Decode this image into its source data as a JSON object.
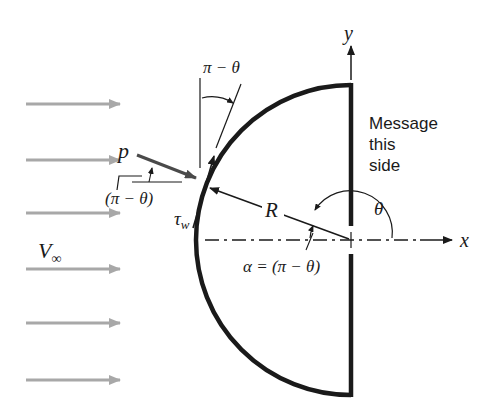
{
  "diagram": {
    "type": "physics-free-body",
    "labels": {
      "y_axis": "y",
      "x_axis": "x",
      "freestream": "V",
      "freestream_sub": "∞",
      "pressure": "p",
      "shear": "τ",
      "shear_sub": "w",
      "radius": "R",
      "theta": "θ",
      "pi_minus_theta_top": "π − θ",
      "pi_minus_theta_paren": "(π − θ)",
      "alpha_eq": "α = (π − θ)",
      "message_line1": "Message",
      "message_line2": "this",
      "message_line3": "side"
    },
    "flow_arrows": {
      "count": 6,
      "y_positions": [
        104,
        160,
        213,
        269,
        323,
        380
      ],
      "x_start": 26,
      "x_end": 120,
      "color": "#a8a8a8"
    },
    "geometry": {
      "center": [
        351,
        240
      ],
      "radius": 155,
      "flat_side_x": 351,
      "flat_top_y": 85,
      "flat_bottom_y": 395
    },
    "colors": {
      "stroke": "#1a1a1a",
      "pressure_arrow": "#4a4a4a",
      "flow": "#a8a8a8"
    }
  }
}
